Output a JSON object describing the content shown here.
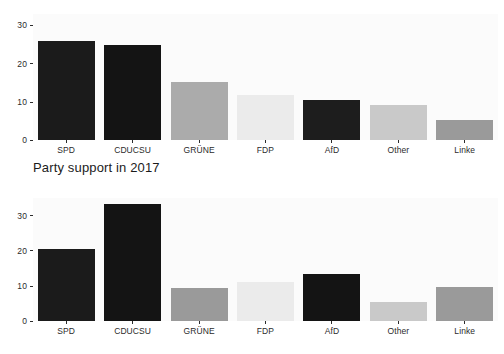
{
  "figure": {
    "background": "#ffffff",
    "plot_background": "#fbfbfb",
    "width": 504,
    "height": 354
  },
  "titles": {
    "middle_title": "Party support in 2017"
  },
  "axis": {
    "y_ticks": [
      "0",
      "10",
      "20",
      "30"
    ],
    "y_tick_values": [
      0,
      10,
      20,
      30
    ],
    "x_labels": [
      "SPD",
      "CDUCSU",
      "GRÜNE",
      "FDP",
      "AfD",
      "Other",
      "Linke"
    ]
  },
  "palette": {
    "spd": "#1b1b1b",
    "cducsu": "#141414",
    "grune": "#ababab",
    "fdp": "#ebebeb",
    "afd": "#1d1d1d",
    "other": "#c9c9c9",
    "linke": "#9a9a9a",
    "tick_color": "#2b2b2b",
    "text_color": "#1b1b1b"
  },
  "chart_data": [
    {
      "type": "bar",
      "id": "chart-top",
      "title": "",
      "xlabel": "",
      "ylabel": "",
      "grid": false,
      "legend": "none",
      "ylim": [
        0,
        33
      ],
      "yticks": [
        0,
        10,
        20,
        30
      ],
      "categories": [
        "SPD",
        "CDUCSU",
        "GRÜNE",
        "FDP",
        "AfD",
        "Other",
        "Linke"
      ],
      "values": [
        26.0,
        24.9,
        15.3,
        11.9,
        10.6,
        9.2,
        5.2
      ],
      "colors": [
        "#1b1b1b",
        "#141414",
        "#ababab",
        "#ebebeb",
        "#1d1d1d",
        "#c9c9c9",
        "#9a9a9a"
      ]
    },
    {
      "type": "bar",
      "id": "chart-bottom",
      "title": "Party support in 2017",
      "xlabel": "",
      "ylabel": "",
      "grid": false,
      "legend": "none",
      "ylim": [
        0,
        35
      ],
      "yticks": [
        0,
        10,
        20,
        30
      ],
      "categories": [
        "SPD",
        "CDUCSU",
        "GRÜNE",
        "FDP",
        "AfD",
        "Other",
        "Linke"
      ],
      "values": [
        20.5,
        33.4,
        9.5,
        11.0,
        13.4,
        5.5,
        9.8
      ],
      "colors": [
        "#1b1b1b",
        "#141414",
        "#9a9a9a",
        "#ebebeb",
        "#141414",
        "#c9c9c9",
        "#9a9a9a"
      ]
    }
  ]
}
